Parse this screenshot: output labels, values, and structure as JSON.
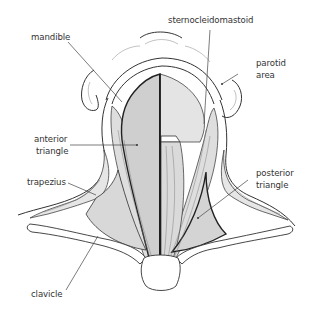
{
  "labels": {
    "mandible": "mandible",
    "sternocleidomastoid": "sternocleidomastoid",
    "parotid_line1": "parotid",
    "parotid_line2": "area",
    "anterior_line1": "anterior",
    "anterior_line2": "triangle",
    "trapezius": "trapezius",
    "posterior_line1": "posterior",
    "posterior_line2": "triangle",
    "clavicle": "clavicle"
  },
  "colors": {
    "anterior_fill": "#cfcfcf",
    "posterior_fill": "#d4d4d4",
    "muscle_fill": "#dedede",
    "skin_fill": "#ffffff",
    "line": "#333333"
  }
}
